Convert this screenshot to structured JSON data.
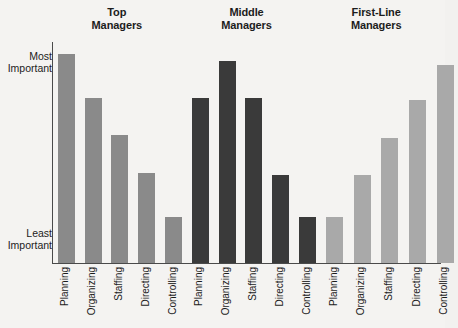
{
  "chart_data": {
    "type": "bar",
    "title": "",
    "xlabel": "",
    "ylabel": "",
    "grid": false,
    "legend_position": "none",
    "orientation": "vertical",
    "grouped": true,
    "categories": [
      "Planning",
      "Organizing",
      "Staffing",
      "Directing",
      "Controlling"
    ],
    "y_axis": {
      "type": "ordinal",
      "top_label": "Most\nImportant",
      "top_label_line1": "Most",
      "top_label_line2": "Important",
      "bottom_label_line1": "Least",
      "bottom_label_line2": "Important",
      "ylim": [
        0,
        100
      ],
      "ticks": [
        "Least Important",
        "Most Important"
      ]
    },
    "series": [
      {
        "name": "Top Managers",
        "name_line1": "Top",
        "name_line2": "Managers",
        "color": "#8a8a8a",
        "values": [
          95,
          75,
          58,
          41,
          21
        ]
      },
      {
        "name": "Middle Managers",
        "name_line1": "Middle",
        "name_line2": "Managers",
        "color": "#3a3a3a",
        "values": [
          75,
          92,
          75,
          40,
          21
        ]
      },
      {
        "name": "First-Line Managers",
        "name_line1": "First-Line",
        "name_line2": "Managers",
        "color": "#a9a9a9",
        "values": [
          21,
          40,
          57,
          74,
          90
        ]
      }
    ]
  },
  "groups": [
    {
      "header_line1": "Top",
      "header_line2": "Managers",
      "color": "#8a8a8a",
      "bars": [
        {
          "label": "Planning",
          "value": 95
        },
        {
          "label": "Organizing",
          "value": 75
        },
        {
          "label": "Staffing",
          "value": 58
        },
        {
          "label": "Directing",
          "value": 41
        },
        {
          "label": "Controlling",
          "value": 21
        }
      ]
    },
    {
      "header_line1": "Middle",
      "header_line2": "Managers",
      "color": "#3a3a3a",
      "bars": [
        {
          "label": "Planning",
          "value": 75
        },
        {
          "label": "Organizing",
          "value": 92
        },
        {
          "label": "Staffing",
          "value": 75
        },
        {
          "label": "Directing",
          "value": 40
        },
        {
          "label": "Controlling",
          "value": 21
        }
      ]
    },
    {
      "header_line1": "First-Line",
      "header_line2": "Managers",
      "color": "#a9a9a9",
      "bars": [
        {
          "label": "Planning",
          "value": 21
        },
        {
          "label": "Organizing",
          "value": 40
        },
        {
          "label": "Staffing",
          "value": 57
        },
        {
          "label": "Directing",
          "value": 74
        },
        {
          "label": "Controlling",
          "value": 90
        }
      ]
    }
  ],
  "axis": {
    "most_important_line1": "Most",
    "most_important_line2": "Important",
    "least_important_line1": "Least",
    "least_important_line2": "Important"
  },
  "colors": {
    "background": "#f4f3f1",
    "axis_line": "#4a4a4a",
    "text": "#1c1c1c",
    "bar_top": "#8a8a8a",
    "bar_middle": "#3a3a3a",
    "bar_first_line": "#a9a9a9"
  }
}
